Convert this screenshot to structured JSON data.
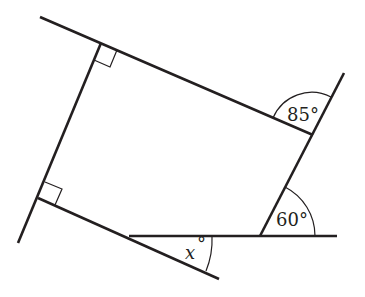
{
  "diagram": {
    "type": "geometry",
    "colors": {
      "stroke": "#231f20",
      "background": "#ffffff"
    },
    "labels": {
      "angle_top_right": "85°",
      "angle_bottom_right": "60°",
      "angle_bottom": "x",
      "angle_bottom_degree": "°"
    },
    "right_angle_markers": 2
  }
}
